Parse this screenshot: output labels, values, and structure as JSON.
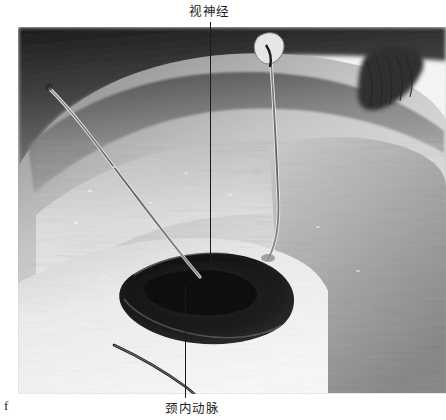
{
  "figure": {
    "letter": "f",
    "kind": "surgical-photograph",
    "color_mode": "grayscale",
    "frame": {
      "x": 18,
      "y": 27,
      "width": 428,
      "height": 367
    }
  },
  "annotations": [
    {
      "id": "optic-nerve",
      "label": "视神经",
      "label_x": 189,
      "label_y": 4,
      "leader": {
        "x": 210,
        "y_start": 22,
        "y_end": 266
      },
      "position": "top"
    },
    {
      "id": "internal-carotid-artery",
      "label": "颈内动脉",
      "label_x": 165,
      "label_y": 401,
      "leader": {
        "x": 185,
        "y_start": 286,
        "y_end": 398
      },
      "position": "bottom"
    }
  ],
  "colors": {
    "background": "#ffffff",
    "label_text": "#1c1c1c",
    "leader_line": "#1b1b1b",
    "tissue_light": "#e6e6e6",
    "tissue_mid": "#a8a8a8",
    "tissue_dark": "#4a4a4a",
    "cavity_dark": "#121212",
    "suture": "#6f6f6f"
  }
}
